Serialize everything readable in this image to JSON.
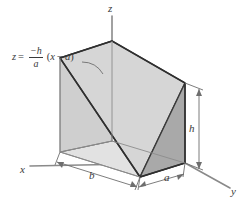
{
  "figure": {
    "background_color": "#ffffff",
    "line_color": "#3a3a3a",
    "faces": {
      "inclined_face_color": "#d6d6d6",
      "right_face_color": "#a9a9a9",
      "back_face_color": "#cccccc",
      "base_face_color": "#e2e2e2"
    },
    "equation": {
      "lhs": "z",
      "equals": "=",
      "numerator": "−h",
      "denominator": "a",
      "open_paren": "(",
      "variable": "x",
      "operator": "−",
      "constant": "a",
      "close_paren": ")"
    },
    "axes": [
      {
        "name": "z-axis",
        "label": "z"
      },
      {
        "name": "x-axis",
        "label": "x"
      },
      {
        "name": "y-axis",
        "label": "y"
      }
    ],
    "dimensions": [
      {
        "name": "depth-dimension",
        "label": "b"
      },
      {
        "name": "width-dimension",
        "label": "a"
      },
      {
        "name": "height-dimension",
        "label": "h"
      }
    ]
  }
}
